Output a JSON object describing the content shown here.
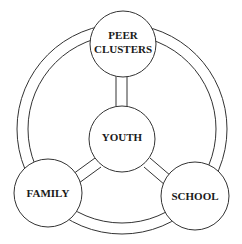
{
  "diagram": {
    "nodes": {
      "peer": {
        "line1": "PEER",
        "line2": "CLUSTERS"
      },
      "youth": {
        "label": "YOUTH"
      },
      "family": {
        "label": "FAMILY"
      },
      "school": {
        "label": "SCHOOL"
      }
    },
    "connections": [
      {
        "from": "youth",
        "to": "peer"
      },
      {
        "from": "youth",
        "to": "family"
      },
      {
        "from": "youth",
        "to": "school"
      }
    ],
    "colors": {
      "stroke": "#333333",
      "fill": "#ffffff",
      "text": "#1a1a1a"
    }
  }
}
